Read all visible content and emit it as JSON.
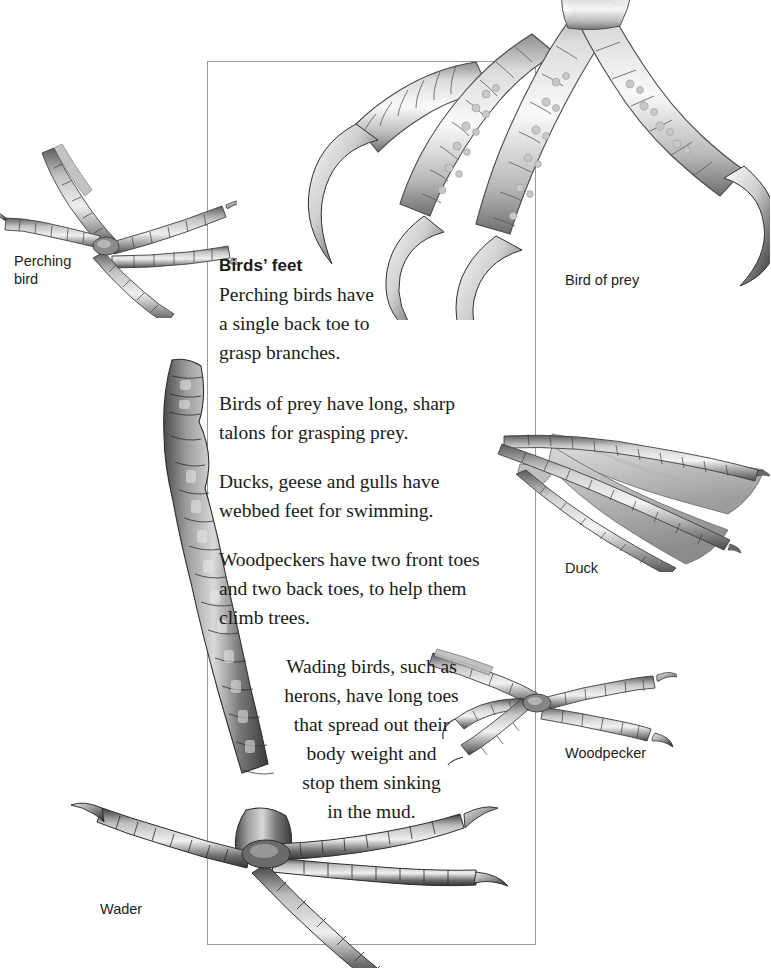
{
  "page": {
    "background_color": "#ffffff",
    "frame_border_color": "#9a9a9a"
  },
  "text_block": {
    "heading": "Birds’ feet",
    "paragraphs": [
      {
        "id": "perching",
        "align": "left",
        "text": "Perching birds have\na single back toe to\ngrasp branches."
      },
      {
        "id": "bird-of-prey",
        "align": "left",
        "text": "Birds of prey have long, sharp\ntalons for grasping prey."
      },
      {
        "id": "duck",
        "align": "left",
        "text": "Ducks, geese and gulls have\nwebbed feet for swimming."
      },
      {
        "id": "woodpecker",
        "align": "left",
        "text": "Woodpeckers have two front toes\nand two back toes, to help them\nclimb trees."
      },
      {
        "id": "wader",
        "align": "center",
        "text": "Wading birds, such as\nherons, have long toes\nthat spread out their\nbody weight and\nstop them sinking\nin the mud."
      }
    ]
  },
  "labels": {
    "perching_bird": "Perching\nbird",
    "bird_of_prey": "Bird of prey",
    "duck": "Duck",
    "woodpecker": "Woodpecker",
    "wader": "Wader"
  },
  "illustrations": [
    {
      "name": "bird-of-prey-foot-illustration",
      "subject": "Bird of prey",
      "description": "Four scaly toes with long sharp curved talons, grayscale pencil illustration"
    },
    {
      "name": "perching-bird-foot-illustration",
      "subject": "Perching bird",
      "description": "Slender scaly foot with three front toes and one back toe, small claws"
    },
    {
      "name": "duck-foot-illustration",
      "subject": "Duck",
      "description": "Webbed foot with membrane stretched between three forward toes"
    },
    {
      "name": "woodpecker-foot-illustration",
      "subject": "Woodpecker",
      "description": "Zygodactyl foot with two front toes and two back toes, curved claws"
    },
    {
      "name": "wader-foot-illustration",
      "subject": "Wader",
      "description": "Long dark segmented leg ending in very long spread toes with claws"
    }
  ]
}
